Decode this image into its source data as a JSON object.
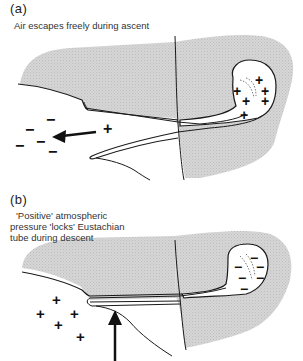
{
  "panel_a": {
    "label": "(a)",
    "caption": "Air escapes freely during ascent",
    "outside_signs": [
      "−",
      "−",
      "−",
      "−",
      "−"
    ],
    "tube_sign": "+",
    "middle_ear_signs": [
      "+",
      "+",
      "+",
      "+",
      "+",
      "+"
    ],
    "arrow_direction": "left"
  },
  "panel_b": {
    "label": "(b)",
    "caption_line1": "'Positive' atmospheric",
    "caption_line2": "pressure 'locks' Eustachian",
    "caption_line3": "tube during descent",
    "outside_signs": [
      "+",
      "+",
      "+",
      "+",
      "+"
    ],
    "middle_ear_signs": [
      "−",
      "−",
      "−",
      "−",
      "−",
      "−"
    ],
    "arrow_direction": "up"
  },
  "colors": {
    "tissue_fill": "#d4d4d4",
    "line": "#1a1a1a",
    "background": "#ffffff"
  }
}
